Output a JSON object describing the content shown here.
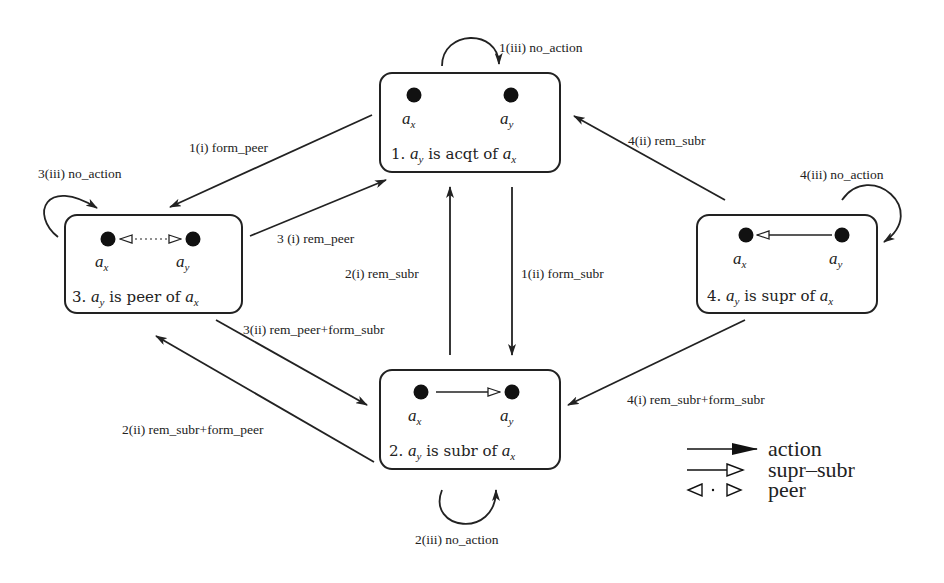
{
  "states": [
    {
      "id": 1,
      "num": "1.",
      "agent_y": "a",
      "sub_y": "y",
      "relation": "is acqt of",
      "agent_x": "a",
      "sub_x": "x",
      "node_left": "a",
      "node_left_sub": "x",
      "node_right": "a",
      "node_right_sub": "y",
      "link": "none"
    },
    {
      "id": 2,
      "num": "2.",
      "agent_y": "a",
      "sub_y": "y",
      "relation": "is subr of",
      "agent_x": "a",
      "sub_x": "x",
      "node_left": "a",
      "node_left_sub": "x",
      "node_right": "a",
      "node_right_sub": "y",
      "link": "supr-subr"
    },
    {
      "id": 3,
      "num": "3.",
      "agent_y": "a",
      "sub_y": "y",
      "relation": "is peer of",
      "agent_x": "a",
      "sub_x": "x",
      "node_left": "a",
      "node_left_sub": "x",
      "node_right": "a",
      "node_right_sub": "y",
      "link": "peer"
    },
    {
      "id": 4,
      "num": "4.",
      "agent_y": "a",
      "sub_y": "y",
      "relation": "is supr of",
      "agent_x": "a",
      "sub_x": "x",
      "node_left": "a",
      "node_left_sub": "x",
      "node_right": "a",
      "node_right_sub": "y",
      "link": "supr-subr-reverse"
    }
  ],
  "transitions": {
    "t1_i": "1(i) form_peer",
    "t1_ii": "1(ii) form_subr",
    "t1_iii": "1(iii) no_action",
    "t2_i": "2(i) rem_subr",
    "t2_ii": "2(ii) rem_subr+form_peer",
    "t2_iii": "2(iii) no_action",
    "t3_i": "3 (i) rem_peer",
    "t3_ii": "3(ii) rem_peer+form_subr",
    "t3_iii": "3(iii) no_action",
    "t4_i": "4(i) rem_subr+form_subr",
    "t4_ii": "4(ii) rem_subr",
    "t4_iii": "4(iii) no_action"
  },
  "legend": {
    "action": "action",
    "supr_subr": "supr–subr",
    "peer": "peer"
  },
  "colors": {
    "ink": "#222222",
    "background": "#ffffff"
  }
}
